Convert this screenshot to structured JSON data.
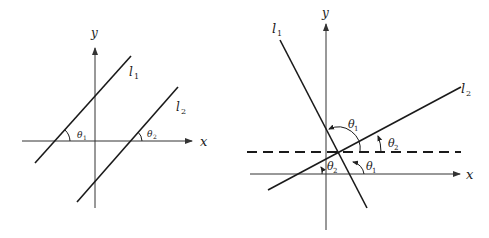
{
  "figures": [
    {
      "name": "parallel-lines",
      "axes": {
        "x_label": "x",
        "y_label": "y"
      },
      "lines": [
        {
          "name": "l",
          "sub": "1"
        },
        {
          "name": "l",
          "sub": "2"
        }
      ],
      "angles": [
        {
          "sym": "θ",
          "sub": "1"
        },
        {
          "sym": "θ",
          "sub": "2"
        }
      ]
    },
    {
      "name": "intersecting-lines",
      "axes": {
        "x_label": "x",
        "y_label": "y"
      },
      "lines": [
        {
          "name": "l",
          "sub": "1"
        },
        {
          "name": "l",
          "sub": "2"
        }
      ],
      "angles": [
        {
          "sym": "θ",
          "sub": "1"
        },
        {
          "sym": "θ",
          "sub": "2"
        },
        {
          "sym": "θ",
          "sub": "1"
        },
        {
          "sym": "θ",
          "sub": "2"
        }
      ]
    }
  ],
  "colors": {
    "ink": "#1a1a1a",
    "axis": "#333333"
  }
}
